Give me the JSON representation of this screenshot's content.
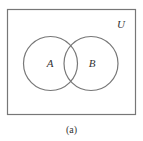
{
  "diagram": {
    "type": "venn",
    "universe_label": "U",
    "sets": [
      {
        "label": "A"
      },
      {
        "label": "B"
      }
    ],
    "caption": "(a)",
    "colors": {
      "stroke": "#777777",
      "text": "#333333",
      "background": "#ffffff"
    }
  }
}
